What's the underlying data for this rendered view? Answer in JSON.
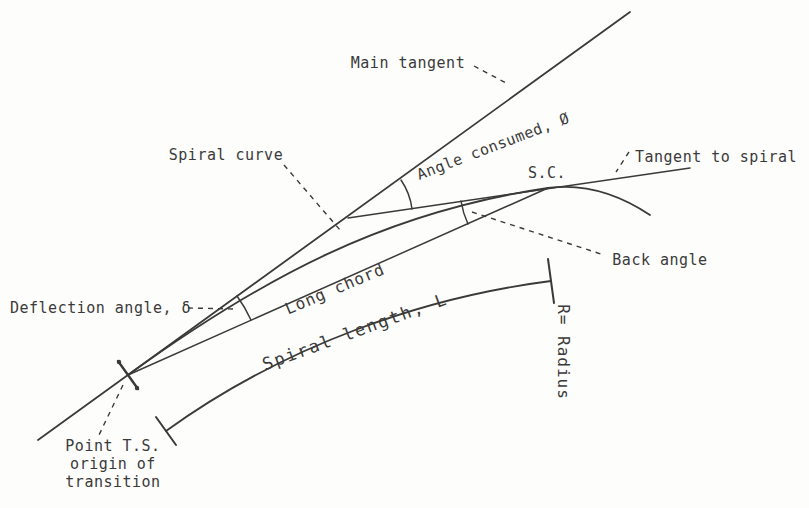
{
  "colors": {
    "ink": "#3a3a3a",
    "background": "#fdfdfb"
  },
  "diagram": {
    "description_labels": {
      "main_tangent": "Main tangent",
      "spiral_curve": "Spiral curve",
      "angle_consumed": "Angle consumed, Ø",
      "tangent_to_spiral": "Tangent to spiral",
      "sc_point": "S.C.",
      "back_angle": "Back angle",
      "long_chord": "Long chord",
      "deflection_angle": "Deflection angle, δ",
      "spiral_length": "Spiral length, L",
      "radius": "R= Radius",
      "point_ts": {
        "lines": [
          "Point T.S.",
          "origin of",
          "transition"
        ]
      }
    }
  }
}
